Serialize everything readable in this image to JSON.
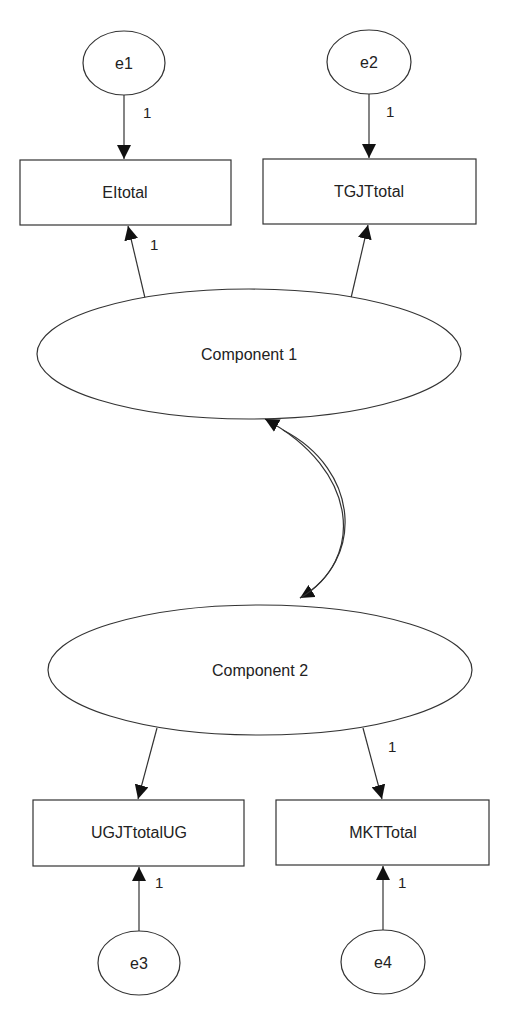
{
  "diagram": {
    "type": "path-diagram",
    "nodes": {
      "e1": {
        "label": "e1",
        "shape": "ellipse"
      },
      "e2": {
        "label": "e2",
        "shape": "ellipse"
      },
      "e3": {
        "label": "e3",
        "shape": "ellipse"
      },
      "e4": {
        "label": "e4",
        "shape": "ellipse"
      },
      "eitotal": {
        "label": "EItotal",
        "shape": "rectangle"
      },
      "tgjttotal": {
        "label": "TGJTtotal",
        "shape": "rectangle"
      },
      "ugjttotalug": {
        "label": "UGJTtotalUG",
        "shape": "rectangle"
      },
      "mkttotal": {
        "label": "MKTTotal",
        "shape": "rectangle"
      },
      "component1": {
        "label": "Component 1",
        "shape": "ellipse"
      },
      "component2": {
        "label": "Component 2",
        "shape": "ellipse"
      }
    },
    "edges": [
      {
        "from": "e1",
        "to": "EItotal",
        "label": "1"
      },
      {
        "from": "e2",
        "to": "TGJTtotal",
        "label": "1"
      },
      {
        "from": "Component 1",
        "to": "EItotal",
        "label": "1"
      },
      {
        "from": "Component 1",
        "to": "TGJTtotal",
        "label": ""
      },
      {
        "from": "Component 1",
        "to": "Component 2",
        "label": "",
        "bidirectional": true
      },
      {
        "from": "Component 2",
        "to": "UGJTtotalUG",
        "label": ""
      },
      {
        "from": "Component 2",
        "to": "MKTTotal",
        "label": "1"
      },
      {
        "from": "e3",
        "to": "UGJTtotalUG",
        "label": "1"
      },
      {
        "from": "e4",
        "to": "MKTTotal",
        "label": "1"
      }
    ],
    "edge_labels": {
      "e1_eitotal": "1",
      "e2_tgjt": "1",
      "c1_eitotal": "1",
      "c2_mkt": "1",
      "e3_ugjt": "1",
      "e4_mkt": "1"
    },
    "colors": {
      "stroke": "#333333",
      "background": "#ffffff",
      "text": "#222222"
    }
  }
}
